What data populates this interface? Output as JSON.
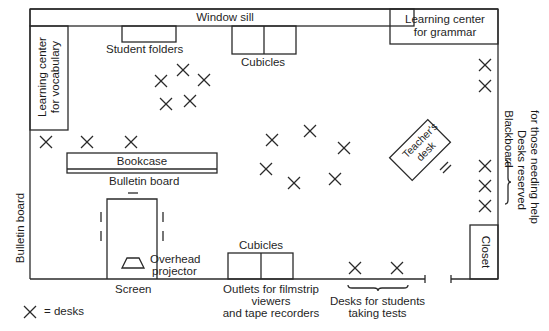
{
  "diagram": {
    "type": "classroom-floor-plan",
    "stroke_color": "#2a2a2a",
    "labels": {
      "window_sill": "Window sill",
      "student_folders": "Student folders",
      "cubicles_top": "Cubicles",
      "learning_center_grammar_line1": "Learning center",
      "learning_center_grammar_line2": "for grammar",
      "learning_center_vocab_line1": "Learning center",
      "learning_center_vocab_line2": "for vocabulary",
      "bookcase": "Bookcase",
      "bulletin_board_inner": "Bulletin board",
      "bulletin_board_wall": "Bulletin board",
      "teachers_desk_line1": "Teacher's",
      "teachers_desk_line2": "desk",
      "blackboard": "Blackboard",
      "desks_reserved_line1": "Desks reserved",
      "desks_reserved_line2": "for those needing help",
      "closet": "Closet",
      "overhead_projector_line1": "Overhead",
      "overhead_projector_line2": "projector",
      "screen": "Screen",
      "cubicles_bottom": "Cubicles",
      "outlets_line1": "Outlets for filmstrip",
      "outlets_line2": "viewers",
      "outlets_line3": "and tape recorders",
      "test_desks_line1": "Desks for students",
      "test_desks_line2": "taking tests",
      "legend_text": "= desks"
    },
    "desk_groups": [
      {
        "name": "center-cluster-top",
        "positions": [
          [
            183,
            70
          ],
          [
            161,
            81
          ],
          [
            204,
            80
          ],
          [
            166,
            104
          ],
          [
            190,
            101
          ]
        ]
      },
      {
        "name": "left-row",
        "positions": [
          [
            46,
            142
          ],
          [
            87,
            142
          ],
          [
            131,
            142
          ]
        ]
      },
      {
        "name": "center-cluster-middle",
        "positions": [
          [
            272,
            140
          ],
          [
            310,
            131
          ],
          [
            344,
            148
          ],
          [
            266,
            169
          ],
          [
            294,
            183
          ],
          [
            335,
            179
          ]
        ]
      },
      {
        "name": "help-desks-right-top",
        "positions": [
          [
            485,
            65
          ],
          [
            485,
            86
          ]
        ]
      },
      {
        "name": "help-desks-right-bottom",
        "positions": [
          [
            485,
            166
          ],
          [
            485,
            186
          ],
          [
            485,
            206
          ]
        ]
      },
      {
        "name": "test-desks",
        "positions": [
          [
            355,
            268
          ],
          [
            397,
            268
          ]
        ]
      }
    ],
    "legend": {
      "symbol": "×",
      "meaning": "desks"
    }
  }
}
